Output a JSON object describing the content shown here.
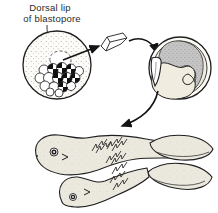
{
  "label": {
    "line1": "Dorsal lip",
    "line2": "of blastopore"
  },
  "colors": {
    "background": "#ffffff",
    "ink": "#1f1f1f",
    "donor_fill": "#fdfcf8",
    "stipple_dot": "#9c9c9c",
    "gray_cap": "#c5c5c5",
    "gray_cap_dot": "#8b8b8b",
    "host_ring": "#fbfaf4",
    "host_interior": "#f0ecdf",
    "graft_white": "#ffffff",
    "tadpole_fill": "#ebe9de",
    "tadpole_dot": "#d6d3c6"
  }
}
